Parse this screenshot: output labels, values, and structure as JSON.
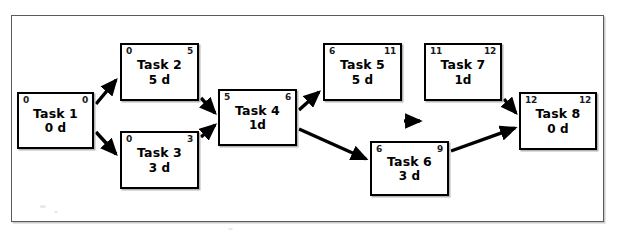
{
  "figure": {
    "type": "precedence-network-diagram",
    "frame_border_color": "#5a5a5a",
    "node_border_color": "#000000",
    "edge_color": "#000000"
  },
  "nodes": [
    {
      "id": "task-1",
      "title": "Task 1",
      "duration": "0 d",
      "early_start": "0",
      "early_finish": "0",
      "x": 17,
      "y": 92,
      "w": 77,
      "h": 57
    },
    {
      "id": "task-2",
      "title": "Task 2",
      "duration": "5 d",
      "early_start": "0",
      "early_finish": "5",
      "x": 120,
      "y": 43,
      "w": 79,
      "h": 58
    },
    {
      "id": "task-3",
      "title": "Task 3",
      "duration": "3 d",
      "early_start": "0",
      "early_finish": "3",
      "x": 120,
      "y": 131,
      "w": 79,
      "h": 58
    },
    {
      "id": "task-4",
      "title": "Task 4",
      "duration": "1d",
      "early_start": "5",
      "early_finish": "6",
      "x": 218,
      "y": 89,
      "w": 79,
      "h": 57
    },
    {
      "id": "task-5",
      "title": "Task 5",
      "duration": "5 d",
      "early_start": "6",
      "early_finish": "11",
      "x": 323,
      "y": 43,
      "w": 79,
      "h": 58
    },
    {
      "id": "task-6",
      "title": "Task 6",
      "duration": "3 d",
      "early_start": "6",
      "early_finish": "9",
      "x": 370,
      "y": 141,
      "w": 79,
      "h": 55
    },
    {
      "id": "task-7",
      "title": "Task 7",
      "duration": "1d",
      "early_start": "11",
      "early_finish": "12",
      "x": 424,
      "y": 43,
      "w": 78,
      "h": 58
    },
    {
      "id": "task-8",
      "title": "Task 8",
      "duration": "0 d",
      "early_start": "12",
      "early_finish": "12",
      "x": 519,
      "y": 92,
      "w": 78,
      "h": 58
    }
  ],
  "edges": [
    {
      "from": "task-1",
      "to": "task-2",
      "d": "M 96,104 L 116,80"
    },
    {
      "from": "task-1",
      "to": "task-3",
      "d": "M 96,132 L 116,154"
    },
    {
      "from": "task-2",
      "to": "task-4",
      "d": "M 201,98 L 215,113"
    },
    {
      "from": "task-3",
      "to": "task-4",
      "d": "M 201,137 L 215,125"
    },
    {
      "from": "task-4",
      "to": "task-5",
      "d": "M 299,110 L 319,92"
    },
    {
      "from": "task-4",
      "to": "task-6",
      "d": "M 299,129 L 366,159"
    },
    {
      "from": "task-5",
      "to": "task-7",
      "d": "M 404,121 L 420,121"
    },
    {
      "from": "task-7",
      "to": "task-8",
      "d": "M 504,99 L 516,113"
    },
    {
      "from": "task-6",
      "to": "task-8",
      "d": "M 451,151 L 515,128"
    }
  ]
}
